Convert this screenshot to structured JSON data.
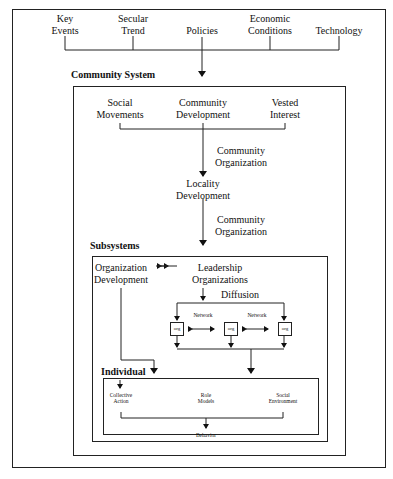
{
  "top_factors": [
    {
      "line1": "Key",
      "line2": "Events"
    },
    {
      "line1": "Secular",
      "line2": "Trend"
    },
    {
      "line1": "",
      "line2": "Policies"
    },
    {
      "line1": "Economic",
      "line2": "Conditions"
    },
    {
      "line1": "",
      "line2": "Technology"
    }
  ],
  "community_system": {
    "title": "Community System",
    "inputs": [
      {
        "line1": "Social",
        "line2": "Movements"
      },
      {
        "line1": "Community",
        "line2": "Development"
      },
      {
        "line1": "Vested",
        "line2": "Interest"
      }
    ],
    "edge_label_1": {
      "line1": "Community",
      "line2": "Organization"
    },
    "locality": {
      "line1": "Locality",
      "line2": "Development"
    },
    "edge_label_2": {
      "line1": "Community",
      "line2": "Organization"
    }
  },
  "subsystems": {
    "title": "Subsystems",
    "org_development": {
      "line1": "Organization",
      "line2": "Development"
    },
    "leadership": {
      "line1": "Leadership",
      "line2": "Organizations"
    },
    "diffusion_label": "Diffusion",
    "network_labels": [
      "Network",
      "Network"
    ],
    "org_boxes": [
      "org",
      "org",
      "org"
    ]
  },
  "individual": {
    "title": "Individual",
    "items": [
      {
        "line1": "Collective",
        "line2": "Action"
      },
      {
        "line1": "Role",
        "line2": "Models"
      },
      {
        "line1": "Social",
        "line2": "Environment"
      }
    ],
    "outcome": "Behavior"
  }
}
